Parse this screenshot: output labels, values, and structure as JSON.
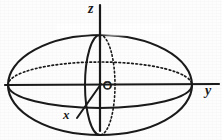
{
  "figure": {
    "kind": "3d-geometry-sketch",
    "background_color": "#fdfdfd",
    "ink_color": "#1a1a1a"
  },
  "labels": {
    "z_axis": "z",
    "y_axis": "y",
    "x_axis": "x",
    "origin": "O"
  },
  "geometry": {
    "center": {
      "x": 100,
      "y": 85
    },
    "outer_ellipse": {
      "rx": 92,
      "ry": 50,
      "style": "solid"
    },
    "equator_ellipse": {
      "rx": 92,
      "ry": 23,
      "front_style": "solid",
      "back_style": "dotted"
    },
    "meridian_ellipse": {
      "rx": 15,
      "ry": 50,
      "front_style": "solid",
      "back_style": "dotted"
    },
    "axes": [
      {
        "name": "z",
        "from": {
          "x": 100,
          "y": 5
        },
        "to": {
          "x": 100,
          "y": 131
        },
        "style": "solid"
      },
      {
        "name": "y",
        "from": {
          "x": 6,
          "y": 85
        },
        "to": {
          "x": 219,
          "y": 84
        },
        "style": "solid"
      },
      {
        "name": "x",
        "from": {
          "x": 100,
          "y": 85
        },
        "to": {
          "x": 77,
          "y": 117
        },
        "style": "solid"
      }
    ],
    "origin_marker": {
      "x": 107,
      "y": 85,
      "r": 4,
      "style": "small-circle"
    }
  }
}
